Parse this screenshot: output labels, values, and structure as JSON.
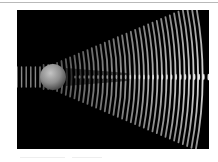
{
  "figure": {
    "alt": "Plane waves diffracting around an opaque sphere, forming a bright central spot and spreading wavefronts",
    "colors": {
      "background": "#000000",
      "wave": "#ffffff",
      "sphere_light": "#b8b8b8",
      "sphere_dark": "#5a5a5a"
    }
  }
}
